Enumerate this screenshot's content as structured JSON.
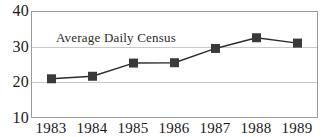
{
  "chart_data": {
    "type": "line",
    "title": "",
    "series_label": "Average Daily Census",
    "xlabel": "",
    "ylabel": "",
    "categories": [
      "1983",
      "1984",
      "1985",
      "1986",
      "1987",
      "1988",
      "1989"
    ],
    "x": [
      1983,
      1984,
      1985,
      1986,
      1987,
      1988,
      1989
    ],
    "series": [
      {
        "name": "Average Daily Census",
        "values": [
          21.0,
          21.7,
          25.4,
          25.5,
          29.5,
          32.5,
          31.0
        ]
      }
    ],
    "ylim": [
      10,
      40
    ],
    "yticks": [
      10,
      20,
      30,
      40
    ],
    "ytick_labels": [
      "10",
      "20",
      "30",
      "40"
    ],
    "grid": true,
    "grid_axis": "y",
    "legend": "none",
    "marker": "square",
    "marker_color": "#3a3a3a",
    "line_color": "#2d2d2d",
    "grid_color": "#c9c9c9",
    "frame_color": "#9a9a9a",
    "background_color": "#ffffff",
    "text_color": "#1a1a1a"
  }
}
